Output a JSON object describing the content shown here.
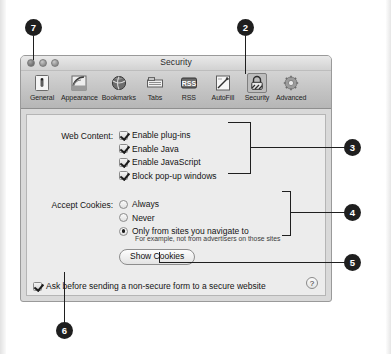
{
  "window": {
    "title": "Security",
    "traffic_lights": [
      "close",
      "minimize",
      "zoom"
    ]
  },
  "toolbar": {
    "items": [
      {
        "label": "General",
        "icon": "general-icon",
        "selected": false
      },
      {
        "label": "Appearance",
        "icon": "appearance-icon",
        "selected": false
      },
      {
        "label": "Bookmarks",
        "icon": "bookmarks-icon",
        "selected": false
      },
      {
        "label": "Tabs",
        "icon": "tabs-icon",
        "selected": false
      },
      {
        "label": "RSS",
        "icon": "rss-icon",
        "selected": false
      },
      {
        "label": "AutoFill",
        "icon": "autofill-icon",
        "selected": false
      },
      {
        "label": "Security",
        "icon": "security-lock-icon",
        "selected": true
      },
      {
        "label": "Advanced",
        "icon": "advanced-gear-icon",
        "selected": false
      }
    ]
  },
  "panel": {
    "web_content": {
      "label": "Web Content:",
      "options": [
        {
          "text": "Enable plug-ins",
          "checked": true
        },
        {
          "text": "Enable Java",
          "checked": true
        },
        {
          "text": "Enable JavaScript",
          "checked": true
        },
        {
          "text": "Block pop-up windows",
          "checked": true
        }
      ]
    },
    "accept_cookies": {
      "label": "Accept Cookies:",
      "options": [
        {
          "text": "Always",
          "selected": false
        },
        {
          "text": "Never",
          "selected": false
        },
        {
          "text": "Only from sites you navigate to",
          "selected": true
        }
      ],
      "sub_text": "For example, not from advertisers on those sites",
      "button_label": "Show Cookies"
    },
    "secure_form": {
      "text": "Ask before sending a non-secure form to a secure website",
      "checked": true
    },
    "help_label": "?"
  },
  "callouts": [
    {
      "number": "7",
      "target": "close-button"
    },
    {
      "number": "2",
      "target": "security-toolbar-item"
    },
    {
      "number": "3",
      "target": "web-content-group"
    },
    {
      "number": "4",
      "target": "accept-cookies-group"
    },
    {
      "number": "5",
      "target": "show-cookies-button"
    },
    {
      "number": "6",
      "target": "secure-form-checkbox"
    }
  ],
  "colors": {
    "callout_bg": "#1f1f1f",
    "callout_text": "#ffffff",
    "panel_bg": "#ececec",
    "toolbar_bg": "#c4c4c4"
  }
}
